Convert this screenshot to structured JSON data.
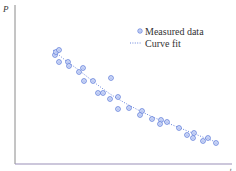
{
  "chart_data": {
    "type": "scatter",
    "title": "",
    "xlabel": "t",
    "ylabel": "P",
    "grid": false,
    "legend_position": "upper-right",
    "legend": [
      {
        "label": "Measured data",
        "marker": "circle-dot",
        "color": "#5a78d8"
      },
      {
        "label": "Curve fit",
        "style": "dotted-line",
        "color": "#5a78d8"
      }
    ],
    "series": [
      {
        "name": "Measured data",
        "type": "scatter",
        "points_px": [
          [
            55,
            55
          ],
          [
            56,
            52
          ],
          [
            59,
            50
          ],
          [
            59,
            62
          ],
          [
            68,
            62
          ],
          [
            69,
            66
          ],
          [
            79,
            72
          ],
          [
            83,
            68
          ],
          [
            84,
            81
          ],
          [
            93,
            81
          ],
          [
            111,
            78
          ],
          [
            98,
            93
          ],
          [
            103,
            93
          ],
          [
            110,
            99
          ],
          [
            118,
            97
          ],
          [
            118,
            109
          ],
          [
            129,
            108
          ],
          [
            142,
            111
          ],
          [
            140,
            115
          ],
          [
            152,
            119
          ],
          [
            161,
            120
          ],
          [
            160,
            124
          ],
          [
            167,
            122
          ],
          [
            179,
            128
          ],
          [
            187,
            135
          ],
          [
            194,
            133
          ],
          [
            193,
            138
          ],
          [
            203,
            141
          ],
          [
            208,
            138
          ],
          [
            216,
            143
          ]
        ]
      },
      {
        "name": "Curve fit",
        "type": "line",
        "points_px": [
          [
            53,
            50
          ],
          [
            65,
            60
          ],
          [
            80,
            71
          ],
          [
            95,
            83
          ],
          [
            110,
            94
          ],
          [
            125,
            103
          ],
          [
            140,
            111
          ],
          [
            155,
            118
          ],
          [
            170,
            124
          ],
          [
            185,
            130
          ],
          [
            200,
            136
          ],
          [
            216,
            142
          ]
        ]
      }
    ],
    "axes_px": {
      "origin": [
        15,
        164
      ],
      "x_end": 232,
      "y_end": 5
    },
    "colors": {
      "marker": "#5a78d8",
      "marker_fill": "#dce4fb",
      "axis": "#8a8a8a",
      "axis_bottom_tint": "#9a8fb8"
    }
  }
}
